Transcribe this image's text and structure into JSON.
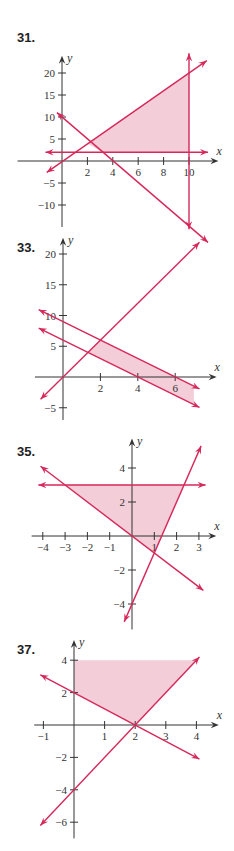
{
  "colors": {
    "line": "#d6285a",
    "fill": "#f3cdd8",
    "axis": "#333333"
  },
  "chart_data": [
    {
      "type": "line",
      "title": "31.",
      "xlabel": "x",
      "ylabel": "y",
      "xlim": [
        -3.5,
        12
      ],
      "ylim": [
        -15,
        23
      ],
      "xticks": [
        2,
        4,
        6,
        8,
        10
      ],
      "yticks": [
        20,
        15,
        10,
        5,
        -5,
        -10
      ],
      "lines": [
        {
          "name": "y = 2x",
          "from": [
            -1.2,
            -2.6
          ],
          "to": [
            11.4,
            22.8
          ]
        },
        {
          "name": "y = -2.5x + 10",
          "from": [
            -0.4,
            11
          ],
          "to": [
            11.5,
            -18.5
          ]
        },
        {
          "name": "y = 2",
          "from": [
            -1.3,
            2
          ],
          "to": [
            11.5,
            2
          ]
        },
        {
          "name": "x = 10",
          "from": [
            10,
            24.5
          ],
          "to": [
            10,
            -15.5
          ]
        }
      ],
      "region": [
        [
          2,
          4
        ],
        [
          10,
          20
        ],
        [
          10,
          2
        ],
        [
          3.2,
          2
        ]
      ],
      "grid": false
    },
    {
      "type": "line",
      "title": "33.",
      "xlabel": "x",
      "ylabel": "y",
      "xlim": [
        -1.5,
        8
      ],
      "ylim": [
        -7,
        22
      ],
      "xticks": [
        2,
        4,
        6
      ],
      "yticks": [
        20,
        15,
        10,
        5,
        -5
      ],
      "lines": [
        {
          "name": "y = 3x",
          "from": [
            -1.2,
            -3.6
          ],
          "to": [
            7.3,
            21.9
          ]
        },
        {
          "name": "y = -1.5x + 9",
          "from": [
            -1.3,
            10.95
          ],
          "to": [
            7.3,
            -1.95
          ]
        },
        {
          "name": "y = -1.5x + 6",
          "from": [
            -1.3,
            7.95
          ],
          "to": [
            7.3,
            -4.95
          ]
        }
      ],
      "region": [
        [
          1.3333,
          4
        ],
        [
          2,
          6
        ],
        [
          7,
          -1.5
        ],
        [
          7,
          -4.5
        ]
      ],
      "grid": false
    },
    {
      "type": "line",
      "title": "35.",
      "xlabel": "x",
      "ylabel": "y",
      "xlim": [
        -4.5,
        3.6
      ],
      "ylim": [
        -5.5,
        5.5
      ],
      "xticks": [
        -4,
        -3,
        -2,
        -1,
        1,
        2,
        3
      ],
      "yticks": [
        4,
        2,
        -2,
        -4
      ],
      "lines": [
        {
          "name": "y = 3",
          "from": [
            -4.2,
            3
          ],
          "to": [
            3.3,
            3
          ]
        },
        {
          "name": "y = -x",
          "from": [
            -4.1,
            4.1
          ],
          "to": [
            3.2,
            -3.2
          ]
        },
        {
          "name": "y = 3x - 4",
          "from": [
            -0.35,
            -5.05
          ],
          "to": [
            3.1,
            5.3
          ]
        }
      ],
      "region": [
        [
          -3,
          3
        ],
        [
          2.3333,
          3
        ],
        [
          1,
          -1
        ]
      ],
      "grid": false
    },
    {
      "type": "line",
      "title": "37.",
      "xlabel": "x",
      "ylabel": "y",
      "xlim": [
        -1.3,
        4.6
      ],
      "ylim": [
        -7,
        5
      ],
      "xticks": [
        -1,
        1,
        2,
        3,
        4
      ],
      "yticks": [
        4,
        2,
        -2,
        -4,
        -6
      ],
      "lines": [
        {
          "name": "y = -x + 2",
          "from": [
            -1.1,
            3.1
          ],
          "to": [
            4.1,
            -2.1
          ]
        },
        {
          "name": "y = 2x - 4",
          "from": [
            -1.1,
            -6.2
          ],
          "to": [
            4.1,
            4.2
          ]
        }
      ],
      "region": [
        [
          0,
          4
        ],
        [
          0,
          2
        ],
        [
          2,
          0
        ],
        [
          4,
          4
        ]
      ],
      "grid": false
    }
  ],
  "layout": [
    {
      "top": 20,
      "label_top": 10,
      "origin": [
        62,
        141
      ],
      "sx": 12.7,
      "sy": 4.4,
      "svg_h": 200
    },
    {
      "top": 230,
      "label_top": 10,
      "origin": [
        63,
        147
      ],
      "sx": 18.7,
      "sy": 6.15,
      "svg_h": 190
    },
    {
      "top": 440,
      "label_top": 4,
      "origin": [
        132,
        96
      ],
      "sx": 22.3,
      "sy": 17.0,
      "svg_h": 190
    },
    {
      "top": 640,
      "label_top": 2,
      "origin": [
        74,
        85
      ],
      "sx": 30.6,
      "sy": 16.2,
      "svg_h": 200
    }
  ]
}
